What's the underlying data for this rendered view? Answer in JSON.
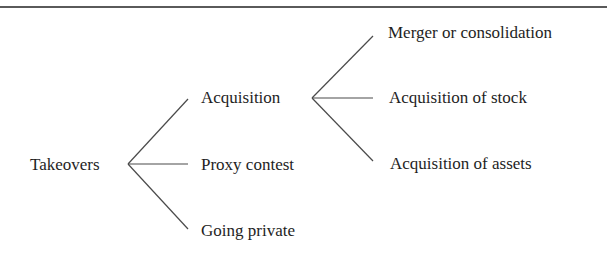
{
  "diagram": {
    "type": "tree",
    "root": {
      "label": "Takeovers",
      "children": [
        {
          "label": "Acquisition",
          "children": [
            {
              "label": "Merger or consolidation"
            },
            {
              "label": "Acquisition of stock"
            },
            {
              "label": "Acquisition of assets"
            }
          ]
        },
        {
          "label": "Proxy contest"
        },
        {
          "label": "Going private"
        }
      ]
    }
  },
  "nodes": {
    "takeovers": "Takeovers",
    "acquisition": "Acquisition",
    "proxy_contest": "Proxy contest",
    "going_private": "Going private",
    "merger": "Merger or consolidation",
    "acq_stock": "Acquisition of stock",
    "acq_assets": "Acquisition of assets"
  },
  "colors": {
    "text": "#1e1e1e",
    "lines": "#4a4a4a",
    "background": "#ffffff"
  }
}
